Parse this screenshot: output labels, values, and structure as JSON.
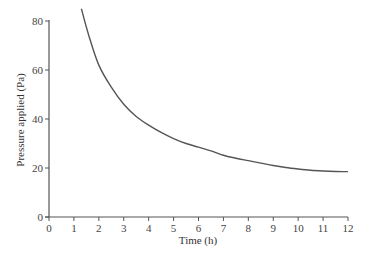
{
  "chart_data": {
    "type": "line",
    "title": "",
    "xlabel": "Time (h)",
    "ylabel": "Pressure applied (Pa)",
    "xlim": [
      0,
      12
    ],
    "ylim": [
      0,
      80
    ],
    "xticks": [
      0,
      1,
      2,
      3,
      4,
      5,
      6,
      7,
      8,
      9,
      10,
      11,
      12
    ],
    "yticks": [
      0,
      20,
      40,
      60,
      80
    ],
    "grid": false,
    "legend": null,
    "series": [
      {
        "name": "Pressure",
        "color": "#555555",
        "x": [
          1.3,
          1.6,
          2.0,
          2.5,
          3.0,
          3.5,
          4.0,
          4.5,
          5.0,
          5.5,
          6.0,
          6.5,
          7.0,
          7.5,
          8.0,
          8.5,
          9.0,
          9.5,
          10.0,
          10.5,
          11.0,
          11.5,
          12.0
        ],
        "y": [
          85,
          74,
          62,
          53,
          46,
          41,
          37.5,
          34.5,
          32,
          30,
          28.5,
          27,
          25.2,
          24,
          23,
          22,
          21,
          20.2,
          19.6,
          19.1,
          18.8,
          18.6,
          18.5
        ]
      }
    ]
  }
}
